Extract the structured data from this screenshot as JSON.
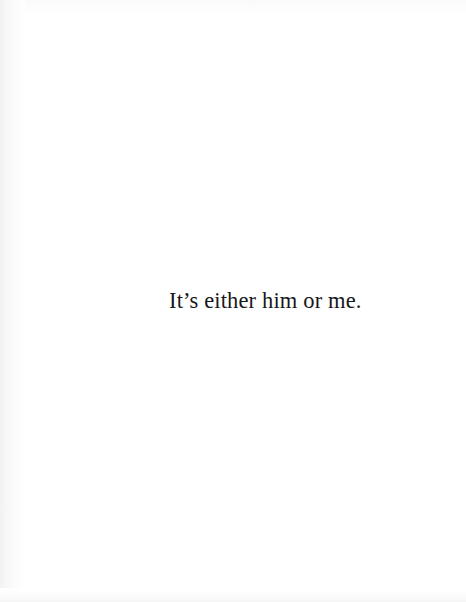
{
  "page": {
    "background_color": "#ffffff",
    "ink_color": "#17171a",
    "width": 466,
    "height": 602,
    "kind": "scanned-book-page"
  },
  "content": {
    "lines": [
      {
        "text": "It’s either him or me.",
        "alignment": "center-ish",
        "style": "serif-roman"
      }
    ]
  },
  "artifacts": {
    "left_edge_shading": "#f2f2f3",
    "top_edge_shading": "#fafafb",
    "bottom_edge_shading": "#f6f6f7"
  }
}
